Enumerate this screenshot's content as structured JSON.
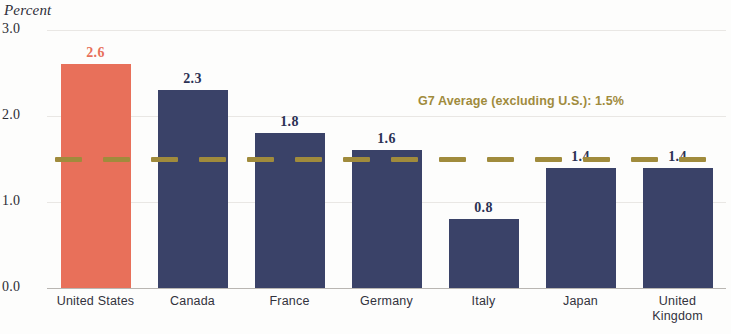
{
  "chart_data": {
    "type": "bar",
    "title": "",
    "subtitle": "",
    "xlabel": "",
    "ylabel": "Percent",
    "ylim": [
      0.0,
      3.0
    ],
    "yticks": [
      "0.0",
      "1.0",
      "2.0",
      "3.0"
    ],
    "ytick_values": [
      0.0,
      1.0,
      2.0,
      3.0
    ],
    "grid": true,
    "legend_position": "none",
    "categories": [
      "United States",
      "Canada",
      "France",
      "Germany",
      "Italy",
      "Japan",
      "United Kingdom"
    ],
    "category_lines": [
      [
        "United States"
      ],
      [
        "Canada"
      ],
      [
        "France"
      ],
      [
        "Germany"
      ],
      [
        "Italy"
      ],
      [
        "Japan"
      ],
      [
        "United",
        "Kingdom"
      ]
    ],
    "values": [
      2.6,
      2.3,
      1.8,
      1.6,
      0.8,
      1.4,
      1.4
    ],
    "value_labels": [
      "2.6",
      "2.3",
      "1.8",
      "1.6",
      "0.8",
      "1.4",
      "1.4"
    ],
    "bar_colors": [
      "#E8705A",
      "#3A4268",
      "#3A4268",
      "#3A4268",
      "#3A4268",
      "#3A4268",
      "#3A4268"
    ],
    "label_colors": [
      "#E8705A",
      "#2B3154",
      "#2B3154",
      "#2B3154",
      "#2B3154",
      "#2B3154",
      "#2B3154"
    ],
    "annotations": [
      {
        "name": "g7-average-line",
        "text": "G7 Average (excluding U.S.): 1.5%",
        "value": 1.5,
        "color": "#A08B3C",
        "style": "dashed"
      }
    ]
  },
  "colors": {
    "highlight": "#E8705A",
    "primary": "#3A4268",
    "accent": "#A08B3C",
    "grid": "#e9e7e4",
    "axis": "#b9b6b2",
    "text": "#2c2c34",
    "background": "#fdfdfc"
  }
}
